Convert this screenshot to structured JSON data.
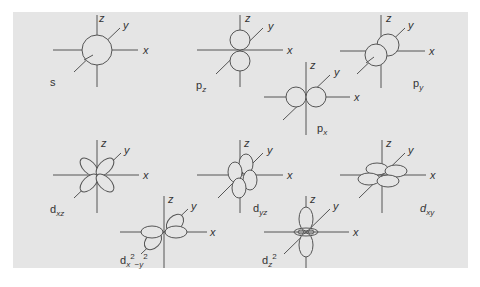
{
  "figure": {
    "background": "#e5e5e5",
    "line_color": "#555555",
    "axes_labels": {
      "x": "x",
      "y": "y",
      "z": "z"
    },
    "orbitals": [
      {
        "id": "s",
        "label_main": "s",
        "label_sub": "",
        "label_sup": ""
      },
      {
        "id": "pz",
        "label_main": "p",
        "label_sub": "z",
        "label_sup": ""
      },
      {
        "id": "py",
        "label_main": "p",
        "label_sub": "y",
        "label_sup": ""
      },
      {
        "id": "px",
        "label_main": "p",
        "label_sub": "x",
        "label_sup": ""
      },
      {
        "id": "dxz",
        "label_main": "d",
        "label_sub": "xz",
        "label_sup": ""
      },
      {
        "id": "dyz",
        "label_main": "d",
        "label_sub": "yz",
        "label_sup": ""
      },
      {
        "id": "dxy",
        "label_main": "d",
        "label_sub": "xy",
        "label_sup": ""
      },
      {
        "id": "dx2y2",
        "label_main": "d",
        "label_sub": "x",
        "label_sup": "2",
        "label_sub2": "−y",
        "label_sup2": "2"
      },
      {
        "id": "dz2",
        "label_main": "d",
        "label_sub": "z",
        "label_sup": "2"
      }
    ]
  }
}
